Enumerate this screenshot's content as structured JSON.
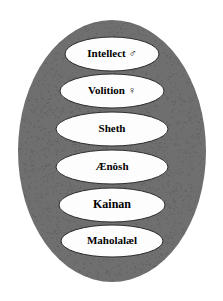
{
  "diagram": {
    "name": "nested-oval-hierarchy",
    "background_color": "#ffffff",
    "outer_oval": {
      "label": "outer-oval",
      "fill_color": "#6f6f6f",
      "shade_color": "#5d5d5d",
      "cx": 112,
      "cy": 151,
      "rx": 94,
      "ry": 131
    },
    "node_fill_color": "#fdfdfd",
    "node_stroke_color": "#2b2b2b",
    "text_color": "#000000",
    "nodes": [
      {
        "id": "intellect",
        "label": "Intellect ♂",
        "text": "Intellect",
        "symbol": "♂",
        "symbol_name": "mars-symbol",
        "cx": 112,
        "cy": 54,
        "rx": 47,
        "ry": 17,
        "font_size": 11
      },
      {
        "id": "volition",
        "label": "Volition ♀",
        "text": "Volition",
        "symbol": "♀",
        "symbol_name": "venus-symbol",
        "cx": 112,
        "cy": 91,
        "rx": 52,
        "ry": 17,
        "font_size": 11
      },
      {
        "id": "sheth",
        "label": "Sheth",
        "text": "Sheth",
        "symbol": "",
        "symbol_name": "",
        "cx": 112,
        "cy": 129,
        "rx": 56,
        "ry": 17,
        "font_size": 11
      },
      {
        "id": "aenosh",
        "label": "Ænôsh",
        "text": "Ænôsh",
        "symbol": "",
        "symbol_name": "",
        "cx": 112,
        "cy": 167,
        "rx": 56,
        "ry": 17,
        "font_size": 11
      },
      {
        "id": "kainan",
        "label": "Kainan",
        "text": "Kainan",
        "symbol": "",
        "symbol_name": "",
        "cx": 112,
        "cy": 205,
        "rx": 53,
        "ry": 17,
        "font_size": 12
      },
      {
        "id": "maholalael",
        "label": "Maholalæl",
        "text": "Maholalæl",
        "symbol": "",
        "symbol_name": "",
        "cx": 112,
        "cy": 241,
        "rx": 51,
        "ry": 16,
        "font_size": 11
      }
    ]
  }
}
